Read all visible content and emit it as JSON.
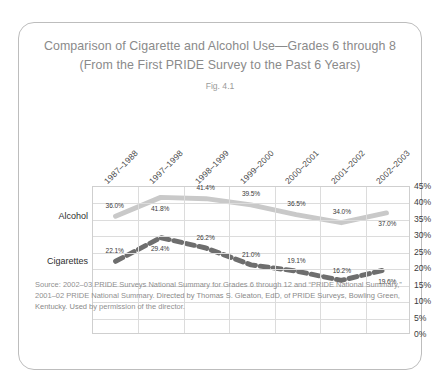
{
  "card": {
    "title_line1": "Comparison of Cigarette and Alcohol Use—Grades 6 through 8",
    "title_line2": "(From the First PRIDE Survey to the Past 6 Years)",
    "figure_label": "Fig. 4.1"
  },
  "source": {
    "line1": "Source: 2002–03 PRIDE Surveys National Summary for Grades 6 through 12 and “PRIDE",
    "line2": "National Summary,” 2001–02 PRIDE National Summary.",
    "line3": "Directed by Thomas S. Gleaton, EdD, of PRIDE Surveys, Bowling Green, Kentucky. Used",
    "line4": "by permission of the director."
  },
  "chart_data": {
    "type": "line",
    "title": "Comparison of Cigarette and Alcohol Use—Grades 6 through 8",
    "subtitle": "(From the First PRIDE Survey to the Past 6 Years)",
    "figure": "Fig. 4.1",
    "xlabel": "",
    "ylabel": "",
    "categories": [
      "1987–1988",
      "1997–1998",
      "1998–1999",
      "1999–2000",
      "2000–2001",
      "2001–2002",
      "2002–2003"
    ],
    "ylim": [
      0,
      45
    ],
    "ytick_labels": [
      "45%",
      "40%",
      "35%",
      "30%",
      "25%",
      "20%",
      "15%",
      "10%",
      "5%",
      "0%"
    ],
    "ytick_values": [
      45,
      40,
      35,
      30,
      25,
      20,
      15,
      10,
      5,
      0
    ],
    "grid": true,
    "legend_position": "inline-left",
    "series": [
      {
        "name": "Alcohol",
        "style": "solid",
        "color": "#c9c9c9",
        "values": [
          36.0,
          41.8,
          41.4,
          39.5,
          36.5,
          34.0,
          37.0
        ],
        "labels": [
          "36.0%",
          "41.8%",
          "41.4%",
          "39.5%",
          "36.5%",
          "34.0%",
          "37.0%"
        ]
      },
      {
        "name": "Cigarettes",
        "style": "dashed",
        "color": "#6e6e6e",
        "values": [
          22.1,
          29.4,
          26.2,
          21.0,
          19.1,
          16.2,
          19.6
        ],
        "labels": [
          "22.1%",
          "29.4%",
          "26.2%",
          "21.0%",
          "19.1%",
          "16.2%",
          "19.6%"
        ]
      }
    ]
  }
}
